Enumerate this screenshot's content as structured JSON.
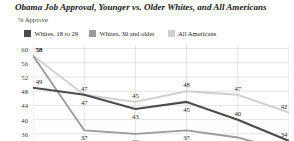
{
  "header": {
    "title": "Obama Job Approval, Younger vs. Older Whites, and All Americans",
    "subtitle": "% Approve"
  },
  "legend": {
    "position": "top-left",
    "items": [
      {
        "label": "Whites, 18 to 29",
        "color": "#4c4c4c",
        "swatch_name": "legend-swatch-whites-18-29"
      },
      {
        "label": "Whites, 30 and older",
        "color": "#9a9a9a",
        "swatch_name": "legend-swatch-whites-30-older"
      },
      {
        "label": "All Americans",
        "color": "#cfcfcf",
        "swatch_name": "legend-swatch-all-americans"
      }
    ]
  },
  "axis": {
    "yticks": [
      "60",
      "56",
      "52",
      "48",
      "44",
      "40",
      "36"
    ],
    "ylim": [
      34,
      61
    ],
    "grid": true
  },
  "chart_data": {
    "type": "line",
    "title": "Obama Job Approval, Younger vs. Older Whites, and All Americans",
    "subtitle": "% Approve",
    "xlabel": "",
    "ylabel": "% Approve",
    "ylim": [
      34,
      61
    ],
    "yticks": [
      60,
      56,
      52,
      48,
      44,
      40,
      36
    ],
    "grid": true,
    "legend_position": "top-left",
    "x": [
      0,
      1,
      2,
      3,
      4,
      5
    ],
    "categories": [
      "",
      "",
      "",
      "",
      "",
      ""
    ],
    "series": [
      {
        "name": "Whites, 18 to 29",
        "color": "#4c4c4c",
        "values": [
          49,
          47,
          43,
          45,
          40,
          34
        ],
        "labels": [
          "49",
          "47",
          "43",
          "45",
          "40",
          "34"
        ]
      },
      {
        "name": "Whites, 30 and older",
        "color": "#9a9a9a",
        "values": [
          58,
          37,
          36,
          37,
          35,
          31
        ],
        "labels": [
          "58",
          "37",
          "36",
          "37",
          "35",
          ""
        ]
      },
      {
        "name": "All Americans",
        "color": "#cfcfcf",
        "values": [
          58,
          47,
          45,
          48,
          47,
          42
        ],
        "labels": [
          "58",
          "47",
          "45",
          "48",
          "47",
          "42"
        ]
      }
    ]
  }
}
